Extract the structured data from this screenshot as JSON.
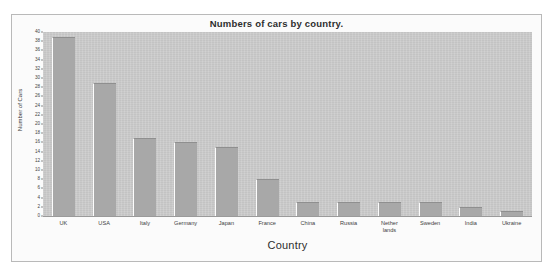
{
  "chart_data": {
    "type": "bar",
    "title": "Numbers of cars by country.",
    "xlabel": "Country",
    "ylabel": "Number of Cars",
    "categories": [
      "UK",
      "USA",
      "Italy",
      "Germany",
      "Japan",
      "France",
      "China",
      "Russia",
      "Nether\nlands",
      "Sweden",
      "India",
      "Ukraine"
    ],
    "values": [
      39,
      29,
      17,
      16,
      15,
      8,
      3,
      3,
      3,
      3,
      2,
      1
    ],
    "ylim": [
      0,
      40
    ],
    "ytick_step": 2,
    "yticks": [
      0,
      2,
      4,
      6,
      8,
      10,
      12,
      14,
      16,
      18,
      20,
      22,
      24,
      26,
      28,
      30,
      32,
      34,
      36,
      38,
      40
    ],
    "grid": false,
    "legend": null,
    "colors": {
      "bar_fill": "#a8a8a8",
      "plot_background": "#c9c9c9",
      "figure_background": "#fbfbfb",
      "frame_border": "#b9b9b9",
      "axis_line": "#9a9a9a",
      "text": "#2e2e2e"
    }
  }
}
